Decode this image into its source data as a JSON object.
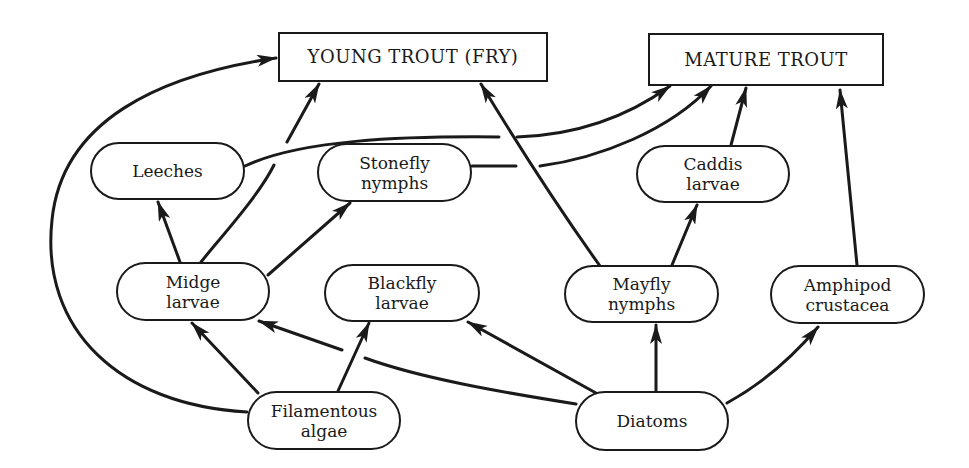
{
  "diagram": {
    "type": "food-web",
    "nodes": {
      "young_trout": {
        "label": "YOUNG TROUT (FRY)",
        "shape": "rect"
      },
      "mature_trout": {
        "label": "MATURE TROUT",
        "shape": "rect"
      },
      "leeches": {
        "label": "Leeches",
        "shape": "pill"
      },
      "stonefly": {
        "label": "Stonefly\nnymphs",
        "shape": "pill"
      },
      "caddis": {
        "label": "Caddis\nlarvae",
        "shape": "pill"
      },
      "midge": {
        "label": "Midge\nlarvae",
        "shape": "pill"
      },
      "blackfly": {
        "label": "Blackfly\nlarvae",
        "shape": "pill"
      },
      "mayfly": {
        "label": "Mayfly\nnymphs",
        "shape": "pill"
      },
      "amphipod": {
        "label": "Amphipod\ncrustacea",
        "shape": "pill"
      },
      "filamentous": {
        "label": "Filamentous\nalgae",
        "shape": "pill"
      },
      "diatoms": {
        "label": "Diatoms",
        "shape": "pill"
      }
    },
    "edges": [
      {
        "from": "Filamentous algae",
        "to": "YOUNG TROUT (FRY)"
      },
      {
        "from": "Filamentous algae",
        "to": "Midge larvae"
      },
      {
        "from": "Filamentous algae",
        "to": "Blackfly larvae"
      },
      {
        "from": "Diatoms",
        "to": "Midge larvae"
      },
      {
        "from": "Diatoms",
        "to": "Blackfly larvae"
      },
      {
        "from": "Diatoms",
        "to": "Mayfly nymphs"
      },
      {
        "from": "Diatoms",
        "to": "Amphipod crustacea"
      },
      {
        "from": "Midge larvae",
        "to": "Leeches"
      },
      {
        "from": "Midge larvae",
        "to": "YOUNG TROUT (FRY)"
      },
      {
        "from": "Midge larvae",
        "to": "Stonefly nymphs"
      },
      {
        "from": "Mayfly nymphs",
        "to": "YOUNG TROUT (FRY)"
      },
      {
        "from": "Mayfly nymphs",
        "to": "Caddis larvae"
      },
      {
        "from": "Leeches",
        "to": "MATURE TROUT"
      },
      {
        "from": "Stonefly nymphs",
        "to": "MATURE TROUT"
      },
      {
        "from": "Caddis larvae",
        "to": "MATURE TROUT"
      },
      {
        "from": "Amphipod crustacea",
        "to": "MATURE TROUT"
      }
    ],
    "colors": {
      "ink": "#1a1a1a",
      "background": "#ffffff"
    }
  }
}
